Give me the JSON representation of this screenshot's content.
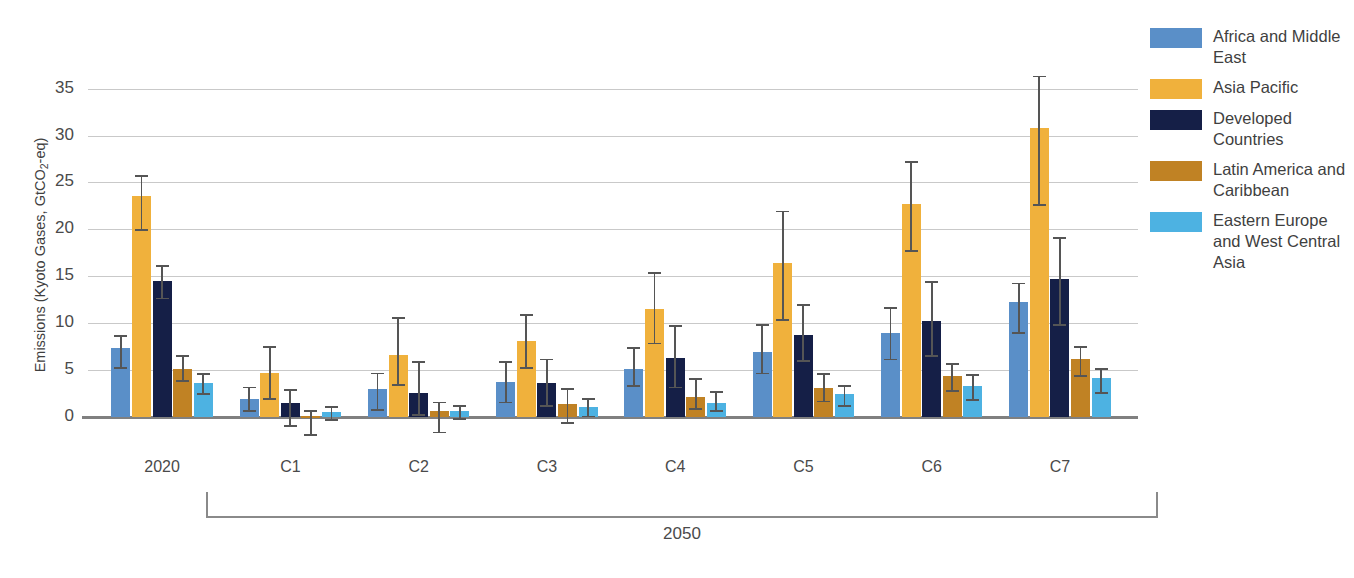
{
  "chart_data": {
    "type": "bar",
    "title": "",
    "xlabel": "",
    "ylabel": "Emissions (Kyoto Gases, GtCO2-eq)",
    "ylabel_parts": {
      "pre": "Emissions (Kyoto Gases, GtCO",
      "sub": "2",
      "post": "-eq)"
    },
    "ylim": [
      -2.5,
      37
    ],
    "yticks": [
      0,
      5,
      10,
      15,
      20,
      25,
      30,
      35
    ],
    "grid": true,
    "legend_position": "right",
    "categories": [
      "2020",
      "C1",
      "C2",
      "C3",
      "C4",
      "C5",
      "C6",
      "C7"
    ],
    "group_bracket": {
      "label": "2050",
      "from": "C1",
      "to": "C7"
    },
    "series": [
      {
        "name": "Africa and Middle East",
        "color": "#5a8fc8",
        "values": [
          7.3,
          1.9,
          2.9,
          3.7,
          5.1,
          6.9,
          8.9,
          12.2
        ],
        "err_low": [
          5.3,
          0.7,
          0.8,
          1.6,
          3.4,
          4.7,
          6.2,
          9.0
        ],
        "err_high": [
          8.7,
          3.2,
          4.7,
          5.9,
          7.4,
          9.9,
          11.7,
          14.3
        ]
      },
      {
        "name": "Asia Pacific",
        "color": "#f0b13c",
        "values": [
          23.5,
          4.6,
          6.6,
          8.1,
          11.5,
          16.4,
          22.7,
          30.8
        ],
        "err_low": [
          20.0,
          2.0,
          3.5,
          5.3,
          7.9,
          10.4,
          17.8,
          22.7
        ],
        "err_high": [
          25.8,
          7.5,
          10.6,
          10.9,
          15.4,
          22.0,
          27.3,
          36.4
        ]
      },
      {
        "name": "Developed Countries",
        "color": "#151f47",
        "values": [
          14.5,
          1.4,
          2.5,
          3.6,
          6.3,
          8.7,
          10.2,
          14.7
        ],
        "err_low": [
          12.7,
          -0.9,
          0.3,
          1.2,
          3.2,
          6.0,
          6.6,
          9.9
        ],
        "err_high": [
          16.2,
          2.9,
          5.9,
          6.2,
          9.8,
          12.0,
          14.5,
          19.2
        ]
      },
      {
        "name": "Latin America and Caribbean",
        "color": "#c08224",
        "values": [
          5.1,
          0.05,
          0.6,
          1.3,
          2.1,
          3.0,
          4.3,
          6.1
        ],
        "err_low": [
          3.9,
          -1.9,
          -1.6,
          -0.6,
          0.9,
          1.7,
          2.8,
          4.4
        ],
        "err_high": [
          6.6,
          0.7,
          1.6,
          3.0,
          4.1,
          4.6,
          5.7,
          7.5
        ]
      },
      {
        "name": "Eastern Europe and West Central Asia",
        "color": "#4db2e2",
        "values": [
          3.6,
          0.5,
          0.6,
          1.0,
          1.5,
          2.4,
          3.3,
          4.1
        ],
        "err_low": [
          2.5,
          -0.3,
          -0.2,
          0.1,
          0.7,
          1.2,
          1.9,
          2.6
        ],
        "err_high": [
          4.6,
          1.1,
          1.2,
          2.0,
          2.7,
          3.4,
          4.5,
          5.2
        ]
      }
    ]
  },
  "legend": {
    "items": [
      {
        "label": "Africa and Middle East",
        "color": "#5a8fc8"
      },
      {
        "label": "Asia Pacific",
        "color": "#f0b13c"
      },
      {
        "label": "Developed Countries",
        "color": "#151f47"
      },
      {
        "label": "Latin America and Caribbean",
        "color": "#c08224"
      },
      {
        "label": "Eastern Europe and West Central Asia",
        "color": "#4db2e2"
      }
    ]
  }
}
